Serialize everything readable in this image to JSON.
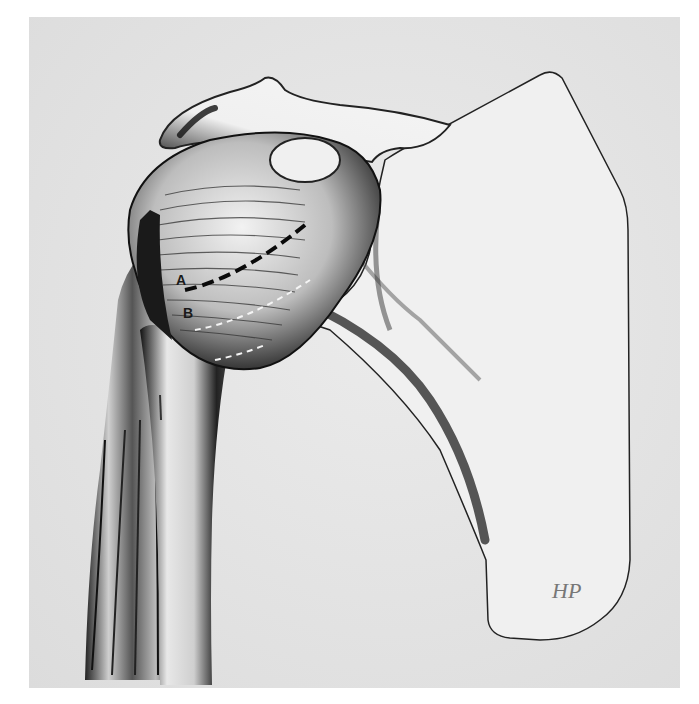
{
  "figure": {
    "labels": [
      {
        "id": "A",
        "text": "A"
      },
      {
        "id": "B",
        "text": "B"
      }
    ],
    "signature": "HP",
    "colors": {
      "background": "#ffffff",
      "panel": "#e3e3e3",
      "ink": "#111111"
    }
  }
}
